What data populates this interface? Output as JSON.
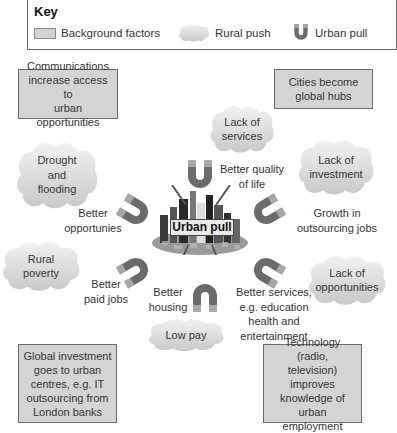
{
  "key": {
    "title": "Key",
    "items": [
      {
        "label": "Background factors",
        "icon": "grey-box"
      },
      {
        "label": "Rural push",
        "icon": "cloud"
      },
      {
        "label": "Urban pull",
        "icon": "magnet"
      }
    ]
  },
  "background_factors": [
    "Communications\nincrease access to\nurban opportunities",
    "Cities become\nglobal hubs",
    "Global investment\ngoes to urban\ncentres, e.g. IT\noutsourcing from\nLondon banks",
    "Technology (radio,\ntelevision) improves\nknowledge of\nurban employment"
  ],
  "rural_push": [
    "Lack of\nservices",
    "Drought\nand\nflooding",
    "Lack of\ninvestment",
    "Rural\npoverty",
    "Lack of\nopportunities",
    "Low pay"
  ],
  "urban_pull": [
    "Better quality\nof life",
    "Better\nopportunies",
    "Growth in\noutsourcing jobs",
    "Better\npaid jobs",
    "Better\nhousing",
    "Better services,\ne.g. education\nhealth and\nentertainment"
  ],
  "center": {
    "label": "Urban pull"
  },
  "colors": {
    "magnet": "#6b6b6b",
    "magnet_tip": "#a8a8a8",
    "box_fill": "#d4d4d4",
    "cloud_fill": "#d9d9d9"
  }
}
